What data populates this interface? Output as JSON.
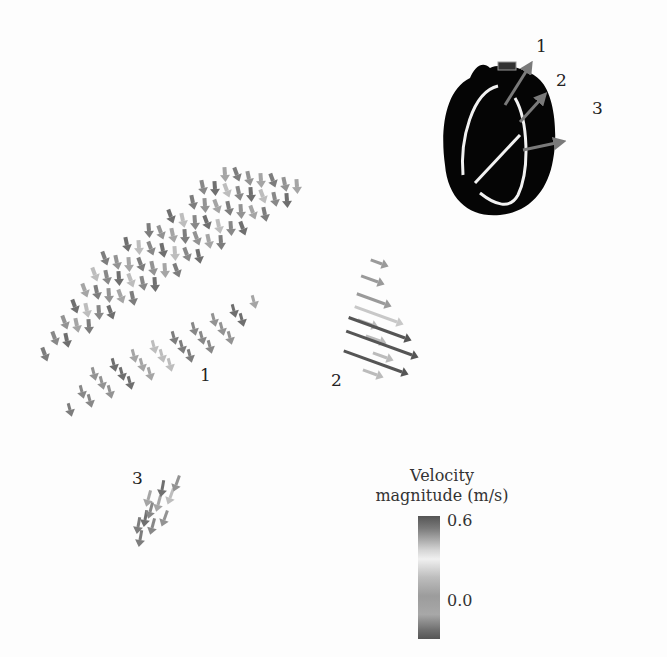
{
  "figure": {
    "region_labels": [
      {
        "id": "1",
        "text": "1"
      },
      {
        "id": "2",
        "text": "2"
      },
      {
        "id": "3",
        "text": "3"
      }
    ],
    "inset": {
      "description": "heart outline with three velocity arrows",
      "arrow_labels": [
        "1",
        "2",
        "3"
      ],
      "arrow_color": "#777777",
      "shape_color": "#000000",
      "outline_color": "#f2f2f2"
    },
    "legend": {
      "title_line1": "Velocity",
      "title_line2": "magnitude (m/s)",
      "max_label": "0.6",
      "min_label": "0.0",
      "min_value": 0.0,
      "max_value": 0.6,
      "colormap": [
        "#555555",
        "#d6d6d6",
        "#f0f0f0",
        "#9c9c9c",
        "#555555"
      ]
    }
  }
}
